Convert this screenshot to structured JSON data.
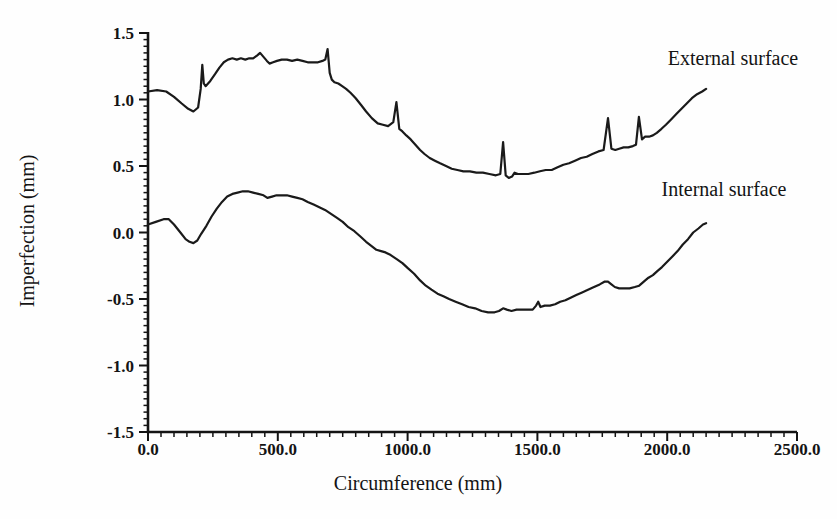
{
  "chart_data": {
    "type": "line",
    "title": "",
    "xlabel": "Circumference (mm)",
    "ylabel": "Imperfection (mm)",
    "xlim": [
      0,
      2500
    ],
    "ylim": [
      -1.5,
      1.5
    ],
    "x_ticks": [
      0,
      500,
      1000,
      1500,
      2000,
      2500
    ],
    "x_tick_labels": [
      "0.0",
      "500.0",
      "1000.0",
      "1500.0",
      "2000.0",
      "2500.0"
    ],
    "x_minor_step": 50,
    "y_ticks": [
      1.5,
      1.0,
      0.5,
      0.0,
      -0.5,
      -1.0,
      -1.5
    ],
    "y_tick_labels": [
      "1.5",
      "1.0",
      "0.5",
      "0.0",
      "-0.5",
      "-1.0",
      "-1.5"
    ],
    "y_minor_step": 0.05,
    "grid": false,
    "legend": "inline annotations on plot",
    "line_color": "#1a1a1a",
    "series": [
      {
        "name": "External surface",
        "points": [
          [
            0,
            1.06
          ],
          [
            35,
            1.07
          ],
          [
            70,
            1.06
          ],
          [
            100,
            1.02
          ],
          [
            130,
            0.97
          ],
          [
            155,
            0.93
          ],
          [
            175,
            0.91
          ],
          [
            193,
            0.94
          ],
          [
            203,
            1.08
          ],
          [
            209,
            1.26
          ],
          [
            215,
            1.12
          ],
          [
            222,
            1.1
          ],
          [
            240,
            1.14
          ],
          [
            258,
            1.19
          ],
          [
            275,
            1.24
          ],
          [
            292,
            1.28
          ],
          [
            308,
            1.3
          ],
          [
            325,
            1.31
          ],
          [
            342,
            1.3
          ],
          [
            358,
            1.31
          ],
          [
            375,
            1.3
          ],
          [
            390,
            1.31
          ],
          [
            405,
            1.31
          ],
          [
            420,
            1.33
          ],
          [
            432,
            1.35
          ],
          [
            445,
            1.32
          ],
          [
            458,
            1.29
          ],
          [
            468,
            1.27
          ],
          [
            482,
            1.28
          ],
          [
            497,
            1.29
          ],
          [
            515,
            1.3
          ],
          [
            535,
            1.3
          ],
          [
            555,
            1.29
          ],
          [
            575,
            1.3
          ],
          [
            595,
            1.29
          ],
          [
            615,
            1.28
          ],
          [
            635,
            1.28
          ],
          [
            655,
            1.28
          ],
          [
            672,
            1.29
          ],
          [
            683,
            1.3
          ],
          [
            692,
            1.38
          ],
          [
            700,
            1.2
          ],
          [
            708,
            1.15
          ],
          [
            718,
            1.13
          ],
          [
            733,
            1.12
          ],
          [
            748,
            1.1
          ],
          [
            763,
            1.08
          ],
          [
            780,
            1.05
          ],
          [
            800,
            1.01
          ],
          [
            820,
            0.96
          ],
          [
            840,
            0.91
          ],
          [
            862,
            0.86
          ],
          [
            885,
            0.82
          ],
          [
            905,
            0.81
          ],
          [
            925,
            0.8
          ],
          [
            945,
            0.83
          ],
          [
            957,
            0.98
          ],
          [
            968,
            0.78
          ],
          [
            980,
            0.76
          ],
          [
            995,
            0.73
          ],
          [
            1012,
            0.7
          ],
          [
            1030,
            0.66
          ],
          [
            1048,
            0.62
          ],
          [
            1065,
            0.59
          ],
          [
            1085,
            0.56
          ],
          [
            1105,
            0.54
          ],
          [
            1125,
            0.52
          ],
          [
            1148,
            0.5
          ],
          [
            1170,
            0.48
          ],
          [
            1192,
            0.47
          ],
          [
            1215,
            0.46
          ],
          [
            1240,
            0.46
          ],
          [
            1265,
            0.45
          ],
          [
            1290,
            0.45
          ],
          [
            1315,
            0.44
          ],
          [
            1340,
            0.43
          ],
          [
            1357,
            0.44
          ],
          [
            1368,
            0.68
          ],
          [
            1378,
            0.43
          ],
          [
            1390,
            0.41
          ],
          [
            1402,
            0.42
          ],
          [
            1412,
            0.45
          ],
          [
            1425,
            0.44
          ],
          [
            1445,
            0.44
          ],
          [
            1465,
            0.44
          ],
          [
            1488,
            0.45
          ],
          [
            1510,
            0.46
          ],
          [
            1532,
            0.47
          ],
          [
            1555,
            0.47
          ],
          [
            1578,
            0.49
          ],
          [
            1600,
            0.51
          ],
          [
            1622,
            0.52
          ],
          [
            1645,
            0.54
          ],
          [
            1668,
            0.56
          ],
          [
            1690,
            0.57
          ],
          [
            1712,
            0.59
          ],
          [
            1735,
            0.61
          ],
          [
            1755,
            0.62
          ],
          [
            1772,
            0.86
          ],
          [
            1785,
            0.63
          ],
          [
            1800,
            0.62
          ],
          [
            1815,
            0.63
          ],
          [
            1832,
            0.64
          ],
          [
            1850,
            0.64
          ],
          [
            1868,
            0.65
          ],
          [
            1880,
            0.66
          ],
          [
            1891,
            0.87
          ],
          [
            1903,
            0.7
          ],
          [
            1915,
            0.72
          ],
          [
            1930,
            0.72
          ],
          [
            1945,
            0.73
          ],
          [
            1960,
            0.75
          ],
          [
            1978,
            0.78
          ],
          [
            1995,
            0.81
          ],
          [
            2015,
            0.85
          ],
          [
            2035,
            0.89
          ],
          [
            2055,
            0.93
          ],
          [
            2075,
            0.97
          ],
          [
            2095,
            1.01
          ],
          [
            2115,
            1.04
          ],
          [
            2135,
            1.06
          ],
          [
            2150,
            1.08
          ]
        ]
      },
      {
        "name": "Internal surface",
        "points": [
          [
            0,
            0.06
          ],
          [
            30,
            0.08
          ],
          [
            60,
            0.1
          ],
          [
            80,
            0.1
          ],
          [
            100,
            0.06
          ],
          [
            125,
            0.0
          ],
          [
            145,
            -0.05
          ],
          [
            160,
            -0.07
          ],
          [
            175,
            -0.08
          ],
          [
            190,
            -0.06
          ],
          [
            205,
            -0.01
          ],
          [
            225,
            0.05
          ],
          [
            245,
            0.12
          ],
          [
            265,
            0.18
          ],
          [
            285,
            0.23
          ],
          [
            305,
            0.27
          ],
          [
            325,
            0.29
          ],
          [
            345,
            0.3
          ],
          [
            365,
            0.31
          ],
          [
            385,
            0.31
          ],
          [
            405,
            0.3
          ],
          [
            425,
            0.29
          ],
          [
            445,
            0.28
          ],
          [
            460,
            0.26
          ],
          [
            478,
            0.27
          ],
          [
            495,
            0.28
          ],
          [
            515,
            0.28
          ],
          [
            535,
            0.28
          ],
          [
            555,
            0.27
          ],
          [
            575,
            0.26
          ],
          [
            595,
            0.25
          ],
          [
            615,
            0.23
          ],
          [
            638,
            0.21
          ],
          [
            660,
            0.19
          ],
          [
            682,
            0.17
          ],
          [
            705,
            0.14
          ],
          [
            728,
            0.11
          ],
          [
            750,
            0.08
          ],
          [
            772,
            0.04
          ],
          [
            795,
            0.01
          ],
          [
            818,
            -0.03
          ],
          [
            840,
            -0.07
          ],
          [
            860,
            -0.1
          ],
          [
            880,
            -0.13
          ],
          [
            898,
            -0.14
          ],
          [
            915,
            -0.15
          ],
          [
            935,
            -0.17
          ],
          [
            958,
            -0.2
          ],
          [
            980,
            -0.23
          ],
          [
            1002,
            -0.27
          ],
          [
            1025,
            -0.31
          ],
          [
            1048,
            -0.36
          ],
          [
            1070,
            -0.4
          ],
          [
            1092,
            -0.43
          ],
          [
            1115,
            -0.46
          ],
          [
            1138,
            -0.48
          ],
          [
            1160,
            -0.5
          ],
          [
            1185,
            -0.52
          ],
          [
            1210,
            -0.54
          ],
          [
            1235,
            -0.56
          ],
          [
            1260,
            -0.57
          ],
          [
            1285,
            -0.59
          ],
          [
            1310,
            -0.6
          ],
          [
            1335,
            -0.6
          ],
          [
            1352,
            -0.59
          ],
          [
            1368,
            -0.57
          ],
          [
            1382,
            -0.58
          ],
          [
            1400,
            -0.59
          ],
          [
            1420,
            -0.58
          ],
          [
            1442,
            -0.58
          ],
          [
            1465,
            -0.58
          ],
          [
            1482,
            -0.58
          ],
          [
            1495,
            -0.55
          ],
          [
            1503,
            -0.52
          ],
          [
            1512,
            -0.56
          ],
          [
            1528,
            -0.55
          ],
          [
            1548,
            -0.55
          ],
          [
            1568,
            -0.54
          ],
          [
            1588,
            -0.52
          ],
          [
            1608,
            -0.51
          ],
          [
            1628,
            -0.49
          ],
          [
            1650,
            -0.47
          ],
          [
            1672,
            -0.45
          ],
          [
            1695,
            -0.43
          ],
          [
            1718,
            -0.41
          ],
          [
            1740,
            -0.39
          ],
          [
            1758,
            -0.37
          ],
          [
            1772,
            -0.37
          ],
          [
            1785,
            -0.39
          ],
          [
            1798,
            -0.41
          ],
          [
            1815,
            -0.42
          ],
          [
            1835,
            -0.42
          ],
          [
            1855,
            -0.42
          ],
          [
            1875,
            -0.41
          ],
          [
            1892,
            -0.4
          ],
          [
            1910,
            -0.37
          ],
          [
            1928,
            -0.34
          ],
          [
            1945,
            -0.32
          ],
          [
            1962,
            -0.29
          ],
          [
            1980,
            -0.26
          ],
          [
            2000,
            -0.22
          ],
          [
            2020,
            -0.18
          ],
          [
            2040,
            -0.14
          ],
          [
            2060,
            -0.09
          ],
          [
            2080,
            -0.05
          ],
          [
            2100,
            0.0
          ],
          [
            2120,
            0.03
          ],
          [
            2138,
            0.06
          ],
          [
            2150,
            0.07
          ]
        ]
      }
    ]
  }
}
